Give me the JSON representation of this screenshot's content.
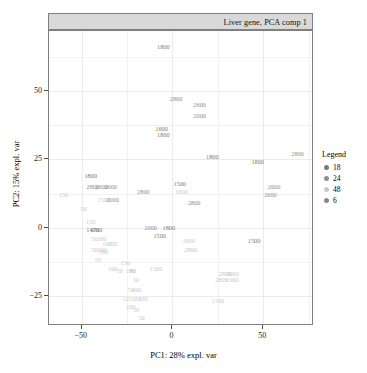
{
  "strip": {
    "label": "Liver gene, PCA comp 1"
  },
  "axes": {
    "x_label": "PC1: 28% expl. var",
    "y_label": "PC2: 15% expl. var",
    "x_ticks": [
      "-50",
      "0",
      "50"
    ],
    "y_ticks": [
      "50",
      "25",
      "0",
      "-25"
    ]
  },
  "legend": {
    "title": "Legend",
    "items": [
      {
        "label": "18",
        "color": "#7a7a7a"
      },
      {
        "label": "24",
        "color": "#8f8f8f"
      },
      {
        "label": "48",
        "color": "#c9c9c9"
      },
      {
        "label": "6",
        "color": "#8a8a8a"
      }
    ]
  },
  "colors": {
    "panel_border": "#7f7f7f",
    "strip_fill": "#d9d9d9",
    "grid": "#ebebeb",
    "group_18": "#7a7a7a",
    "group_24": "#8f8f8f",
    "group_48": "#c9c9c9",
    "group_6": "#8a8a8a"
  },
  "chart_data": {
    "type": "scatter",
    "title": "Liver gene, PCA comp 1",
    "xlabel": "PC1: 28% expl. var",
    "ylabel": "PC2: 15% expl. var",
    "xlim": [
      -68,
      78
    ],
    "ylim": [
      -36,
      72
    ],
    "grid": true,
    "legend_position": "right",
    "legend_title": "Legend",
    "point_render": "text-labels",
    "series": [
      {
        "name": "18",
        "color": "#7a7a7a"
      },
      {
        "name": "24",
        "color": "#8f8f8f"
      },
      {
        "name": "48",
        "color": "#c9c9c9"
      },
      {
        "name": "6",
        "color": "#8a8a8a"
      }
    ],
    "points": [
      {
        "label": "1800",
        "x": -5,
        "y": 66,
        "group": "18"
      },
      {
        "label": "2800",
        "x": 2,
        "y": 47,
        "group": "24"
      },
      {
        "label": "2600",
        "x": 15,
        "y": 45,
        "group": "24"
      },
      {
        "label": "2000",
        "x": 15,
        "y": 41,
        "group": "24"
      },
      {
        "label": "1600",
        "x": -6,
        "y": 36,
        "group": "18"
      },
      {
        "label": "1800",
        "x": -5,
        "y": 34,
        "group": "18"
      },
      {
        "label": "1800",
        "x": 22,
        "y": 26,
        "group": "18"
      },
      {
        "label": "1800",
        "x": 47,
        "y": 24,
        "group": "18"
      },
      {
        "label": "2800",
        "x": 69,
        "y": 27,
        "group": "24"
      },
      {
        "label": "1800",
        "x": -45,
        "y": 19,
        "group": "18"
      },
      {
        "label": "2800",
        "x": -44,
        "y": 15,
        "group": "24"
      },
      {
        "label": "2600",
        "x": -39,
        "y": 15,
        "group": "24"
      },
      {
        "label": "2600",
        "x": -34,
        "y": 15,
        "group": "24"
      },
      {
        "label": "150",
        "x": -60,
        "y": 12,
        "group": "48"
      },
      {
        "label": "1500",
        "x": -38,
        "y": 10,
        "group": "48"
      },
      {
        "label": "2000",
        "x": -33,
        "y": 10,
        "group": "24"
      },
      {
        "label": "2800",
        "x": -16,
        "y": 13,
        "group": "24"
      },
      {
        "label": "1500",
        "x": 4,
        "y": 16,
        "group": "18"
      },
      {
        "label": "1600",
        "x": 5,
        "y": 13,
        "group": "48"
      },
      {
        "label": "2800",
        "x": 12,
        "y": 9,
        "group": "24"
      },
      {
        "label": "2600",
        "x": 56,
        "y": 15,
        "group": "24"
      },
      {
        "label": "2600",
        "x": 54,
        "y": 12,
        "group": "24"
      },
      {
        "label": "50",
        "x": -49,
        "y": 7,
        "group": "48"
      },
      {
        "label": "150",
        "x": -45,
        "y": 2,
        "group": "48"
      },
      {
        "label": "1400",
        "x": -44,
        "y": -1,
        "group": "18"
      },
      {
        "label": "1700",
        "x": -42,
        "y": -1,
        "group": "18"
      },
      {
        "label": "50",
        "x": -43,
        "y": -4,
        "group": "48"
      },
      {
        "label": "180",
        "x": -39,
        "y": -4,
        "group": "48"
      },
      {
        "label": "160",
        "x": -36,
        "y": -6,
        "group": "48"
      },
      {
        "label": "150",
        "x": -33,
        "y": -6,
        "group": "48"
      },
      {
        "label": "50",
        "x": -43,
        "y": -8,
        "group": "48"
      },
      {
        "label": "160",
        "x": -39,
        "y": -8,
        "group": "48"
      },
      {
        "label": "160",
        "x": -38,
        "y": -9,
        "group": "48"
      },
      {
        "label": "50",
        "x": -41,
        "y": -12,
        "group": "48"
      },
      {
        "label": "2000",
        "x": -12,
        "y": 0,
        "group": "24"
      },
      {
        "label": "1800",
        "x": -2,
        "y": 0,
        "group": "18"
      },
      {
        "label": "1500",
        "x": -7,
        "y": -3,
        "group": "18"
      },
      {
        "label": "1800",
        "x": 9,
        "y": -5,
        "group": "48"
      },
      {
        "label": "2800",
        "x": 10,
        "y": -8,
        "group": "48"
      },
      {
        "label": "1500",
        "x": 45,
        "y": -5,
        "group": "18"
      },
      {
        "label": "160",
        "x": -33,
        "y": -15,
        "group": "48"
      },
      {
        "label": "150",
        "x": -26,
        "y": -13,
        "group": "48"
      },
      {
        "label": "50",
        "x": -29,
        "y": -16,
        "group": "48"
      },
      {
        "label": "180",
        "x": -23,
        "y": -16,
        "group": "48"
      },
      {
        "label": "80",
        "x": -22,
        "y": -16,
        "group": "48"
      },
      {
        "label": "1500",
        "x": -9,
        "y": -15,
        "group": "48"
      },
      {
        "label": "2800",
        "x": 29,
        "y": -17,
        "group": "48"
      },
      {
        "label": "2000",
        "x": 33,
        "y": -17,
        "group": "48"
      },
      {
        "label": "2800",
        "x": 27,
        "y": -19,
        "group": "48"
      },
      {
        "label": "1000",
        "x": 33,
        "y": -19,
        "group": "48"
      },
      {
        "label": "50",
        "x": -20,
        "y": -19,
        "group": "48"
      },
      {
        "label": "50",
        "x": -23,
        "y": -23,
        "group": "48"
      },
      {
        "label": "160",
        "x": -20,
        "y": -23,
        "group": "48"
      },
      {
        "label": "125",
        "x": -25,
        "y": -26,
        "group": "48"
      },
      {
        "label": "160",
        "x": -20,
        "y": -26,
        "group": "48"
      },
      {
        "label": "180",
        "x": -16,
        "y": -26,
        "group": "48"
      },
      {
        "label": "100",
        "x": -23,
        "y": -29,
        "group": "48"
      },
      {
        "label": "50",
        "x": -20,
        "y": -30,
        "group": "48"
      },
      {
        "label": "50",
        "x": -17,
        "y": -33,
        "group": "48"
      },
      {
        "label": "1500",
        "x": 25,
        "y": -27,
        "group": "48"
      }
    ]
  }
}
